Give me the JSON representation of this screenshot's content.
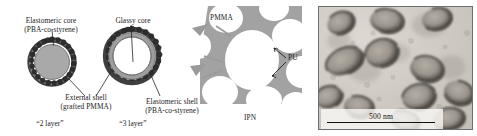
{
  "figure": {
    "caption_present": false,
    "panels": [
      "core-shell-schematic",
      "ipn-schematic",
      "tem-micrograph"
    ]
  },
  "schematic": {
    "two_layer": {
      "core_label_line1": "Elastomeric core",
      "core_label_line2": "(PBA-co-styrene)",
      "shell_label_line1": "External shell",
      "shell_label_line2": "(grafted PMMA)",
      "caption": "“2 layer”",
      "core_color": "#a9a9a9",
      "shell_color": "#4a4a4a"
    },
    "three_layer": {
      "core_label": "Glassy core",
      "shell_label_line1": "Elastomeric shell",
      "shell_label_line2": "(PBA-co-styrene)",
      "caption": "“3 layer”",
      "core_color": "#ffffff",
      "mid_shell_color": "#9e9e9e",
      "outer_shell_color": "#4a4a4a"
    }
  },
  "ipn": {
    "label_pmma": "PMMA",
    "label_pu": "PU",
    "caption": "IPN",
    "network_color": "#9a9a9a",
    "void_color": "#ffffff"
  },
  "tem": {
    "scalebar_label": "500 nm",
    "background_color": "#cfcbc6",
    "particle_rim_color": "#3a3631"
  }
}
